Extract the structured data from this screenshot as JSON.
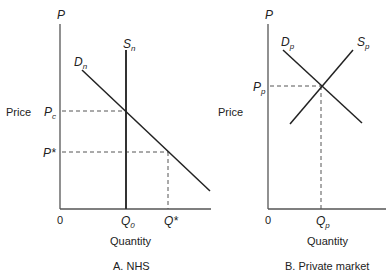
{
  "panels": [
    {
      "caption": "A. NHS",
      "y_axis_top_label": "P",
      "y_axis_title": "Price",
      "x_axis_title": "Quantity",
      "origin_label": "0",
      "demand_label": {
        "main": "D",
        "sub": "n"
      },
      "supply_label": {
        "main": "S",
        "sub": "n"
      },
      "price_labels": [
        {
          "main": "P",
          "sub": "c"
        },
        {
          "main": "P*",
          "sub": ""
        }
      ],
      "quantity_labels": [
        {
          "main": "Q",
          "sub": "0"
        },
        {
          "main": "Q*",
          "sub": ""
        }
      ]
    },
    {
      "caption": "B. Private market",
      "y_axis_top_label": "P",
      "y_axis_title": "Price",
      "x_axis_title": "Quantity",
      "origin_label": "0",
      "demand_label": {
        "main": "D",
        "sub": "p"
      },
      "supply_label": {
        "main": "S",
        "sub": "p"
      },
      "price_labels": [
        {
          "main": "P",
          "sub": "p"
        }
      ],
      "quantity_labels": [
        {
          "main": "Q",
          "sub": "p"
        }
      ]
    }
  ]
}
